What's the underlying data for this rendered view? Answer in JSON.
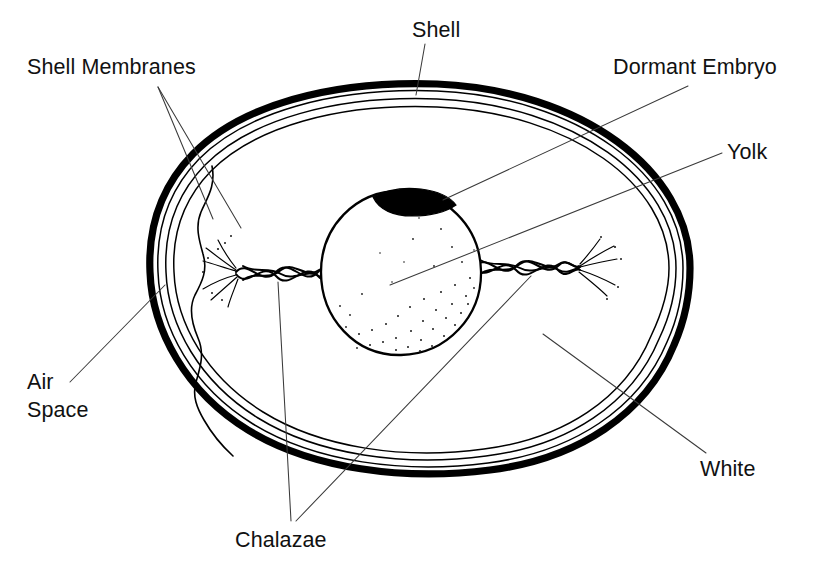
{
  "figure": {
    "background_color": "#ffffff",
    "ink_color": "#000000",
    "leader_color": "#3a3a3a"
  },
  "labels": {
    "shell_membranes": "Shell Membranes",
    "shell": "Shell",
    "dormant_embryo": "Dormant Embryo",
    "yolk": "Yolk",
    "air_space_line1": "Air",
    "air_space_line2": "Space",
    "chalazae": "Chalazae",
    "white": "White"
  },
  "parts": [
    {
      "id": "shell",
      "label": "Shell",
      "description": "Hard outer calcified layer drawn as a heavy black outline"
    },
    {
      "id": "shell-membranes",
      "label": "Shell Membranes",
      "description": "Two thin lines just inside the shell"
    },
    {
      "id": "air-space",
      "label": "Air Space",
      "description": "Pocket at the narrow left end between the membranes and the white"
    },
    {
      "id": "white",
      "label": "White",
      "description": "Albumen filling the egg around the yolk"
    },
    {
      "id": "yolk",
      "label": "Yolk",
      "description": "Large stippled sphere at the centre"
    },
    {
      "id": "dormant-embryo",
      "label": "Dormant Embryo",
      "description": "Dark blastodisc cap on the upper surface of the yolk"
    },
    {
      "id": "chalazae",
      "label": "Chalazae",
      "description": "Twisted rope-like cords anchoring the yolk on both sides"
    }
  ],
  "label_positions": {
    "shell_membranes": {
      "x": 27,
      "y": 74
    },
    "shell": {
      "x": 412,
      "y": 37
    },
    "dormant_embryo": {
      "x": 613,
      "y": 74
    },
    "yolk": {
      "x": 727,
      "y": 159
    },
    "air_space_line1": {
      "x": 27,
      "y": 389
    },
    "air_space_line2": {
      "x": 27,
      "y": 417
    },
    "chalazae": {
      "x": 235,
      "y": 547
    },
    "white": {
      "x": 700,
      "y": 476
    }
  }
}
